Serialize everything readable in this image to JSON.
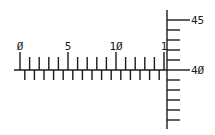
{
  "diagram": {
    "type": "ruler-axes",
    "colors": {
      "line": "#1a1a1a",
      "background": "#ffffff"
    },
    "horizontal_ruler": {
      "origin_x": 20,
      "baseline_y": 70,
      "px_per_unit": 9.6,
      "start_x": 14,
      "end_x": 167,
      "labels": [
        {
          "value": 0,
          "text": "0̸",
          "display": "Ø"
        },
        {
          "value": 5,
          "text": "5",
          "display": "5"
        },
        {
          "value": 10,
          "text": "10",
          "display": "1Ø"
        },
        {
          "value": 15,
          "text": "1",
          "display": "1"
        }
      ],
      "major_every": 5,
      "unit_count": 15
    },
    "vertical_ruler": {
      "axis_x": 167,
      "top_y": 10,
      "bottom_y": 129,
      "labels": [
        {
          "value": 45,
          "text": "45",
          "y": 20
        },
        {
          "value": 40,
          "text": "40",
          "display": "4Ø",
          "y": 70
        }
      ],
      "minor_tick_ys": [
        30,
        40,
        50,
        60,
        80,
        90,
        100,
        110,
        120
      ]
    }
  }
}
